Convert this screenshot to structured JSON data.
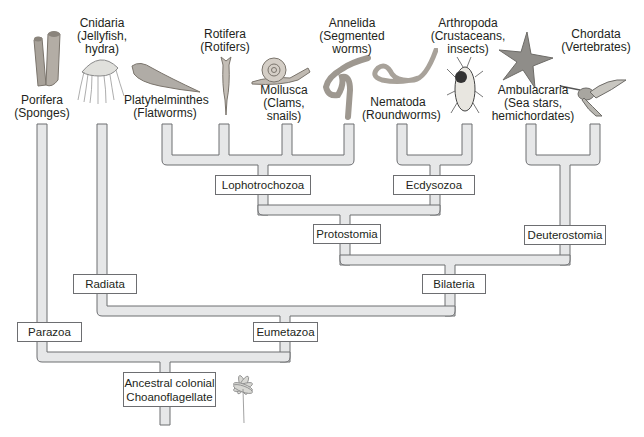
{
  "colors": {
    "branch_fill": "#e6e7e8",
    "branch_stroke": "#6d6e71",
    "box_border": "#6d6e71",
    "text": "#231f20",
    "illustration_gray": "#9a9a9a"
  },
  "taxa": [
    {
      "id": "porifera",
      "name": "Porifera",
      "common": "(Sponges)"
    },
    {
      "id": "cnidaria",
      "name": "Cnidaria",
      "common1": "(Jellyfish,",
      "common2": "hydra)"
    },
    {
      "id": "platyhelminthes",
      "name": "Platyhelminthes",
      "common": "(Flatworms)"
    },
    {
      "id": "rotifera",
      "name": "Rotifera",
      "common": "(Rotifers)"
    },
    {
      "id": "mollusca",
      "name": "Mollusca",
      "common1": "(Clams,",
      "common2": "snails)"
    },
    {
      "id": "annelida",
      "name": "Annelida",
      "common1": "(Segmented",
      "common2": "worms)"
    },
    {
      "id": "nematoda",
      "name": "Nematoda",
      "common": "(Roundworms)"
    },
    {
      "id": "arthropoda",
      "name": "Arthropoda",
      "common1": "(Crustaceans,",
      "common2": "insects)"
    },
    {
      "id": "ambulacraria",
      "name": "Ambulacraria",
      "common1": "(Sea stars,",
      "common2": "hemichordates)"
    },
    {
      "id": "chordata",
      "name": "Chordata",
      "common": "(Vertebrates)"
    }
  ],
  "clades": {
    "lophotrochozoa": "Lophotrochozoa",
    "ecdysozoa": "Ecdysozoa",
    "protostomia": "Protostomia",
    "deuterostomia": "Deuterostomia",
    "bilateria": "Bilateria",
    "radiata": "Radiata",
    "eumetazoa": "Eumetazoa",
    "parazoa": "Parazoa",
    "root_line1": "Ancestral colonial",
    "root_line2": "Choanoflagellate"
  },
  "illustrations": [
    "sponge-illustration",
    "jellyfish-illustration",
    "flatworm-illustration",
    "rotifer-illustration",
    "snail-illustration",
    "segmented-worm-illustration",
    "roundworm-illustration",
    "beetle-illustration",
    "sea-star-illustration",
    "hummingbird-illustration",
    "choanoflagellate-colony-illustration"
  ]
}
